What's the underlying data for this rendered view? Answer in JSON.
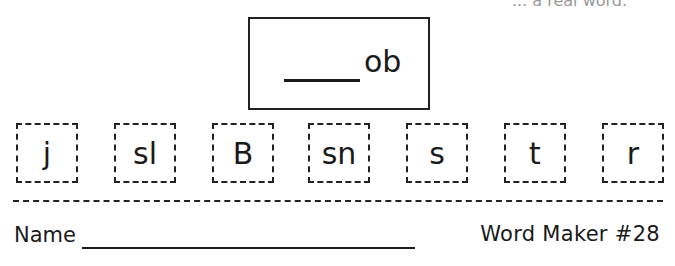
{
  "header": {
    "cut_off_text": "... a real word."
  },
  "word_box": {
    "blank": "____",
    "ending": "ob"
  },
  "tiles": [
    {
      "letters": "j"
    },
    {
      "letters": "sl"
    },
    {
      "letters": "B"
    },
    {
      "letters": "sn"
    },
    {
      "letters": "s"
    },
    {
      "letters": "t"
    },
    {
      "letters": "r"
    }
  ],
  "footer": {
    "name_label": "Name",
    "title": "Word Maker #28"
  }
}
